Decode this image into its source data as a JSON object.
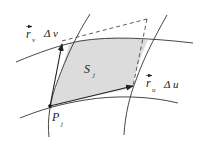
{
  "diagram": {
    "labels": {
      "patch": {
        "main": "S",
        "sub": "j"
      },
      "point": {
        "main": "P",
        "sub": "j"
      },
      "vector_v": {
        "main": "r",
        "sub": "v",
        "factor": "Δ v"
      },
      "vector_u": {
        "main": "r",
        "sub": "u",
        "factor": "Δ u"
      }
    },
    "colors": {
      "stroke": "#333333",
      "fill": "#dcdcdc",
      "background": "#ffffff"
    }
  }
}
